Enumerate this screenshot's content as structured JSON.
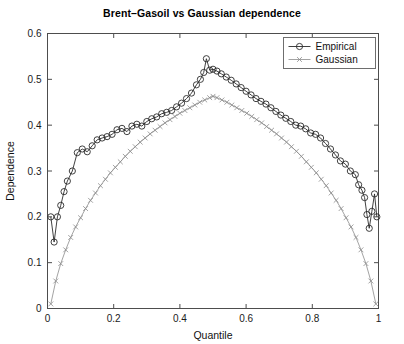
{
  "chart_data": {
    "type": "line",
    "title": "Brent–Gasoil vs Gaussian dependence",
    "xlabel": "Quantile",
    "ylabel": "Dependence",
    "xlim": [
      0,
      1
    ],
    "ylim": [
      0,
      0.6
    ],
    "xticks": [
      "0",
      "0.2",
      "0.4",
      "0.6",
      "0.8",
      "1"
    ],
    "xtick_values": [
      0,
      0.2,
      0.4,
      0.6,
      0.8,
      1
    ],
    "yticks": [
      "0",
      "0.1",
      "0.2",
      "0.3",
      "0.4",
      "0.5",
      "0.6"
    ],
    "ytick_values": [
      0,
      0.1,
      0.2,
      0.3,
      0.4,
      0.5,
      0.6
    ],
    "grid": false,
    "legend_position": "top-right",
    "legend": [
      "Empirical",
      "Gaussian"
    ],
    "series": [
      {
        "name": "Empirical",
        "marker": "circle",
        "color": "#2b2b2b",
        "x": [
          0.01,
          0.02,
          0.03,
          0.04,
          0.05,
          0.06,
          0.075,
          0.09,
          0.105,
          0.12,
          0.135,
          0.15,
          0.165,
          0.18,
          0.195,
          0.21,
          0.225,
          0.24,
          0.255,
          0.27,
          0.285,
          0.3,
          0.315,
          0.33,
          0.345,
          0.36,
          0.375,
          0.39,
          0.405,
          0.42,
          0.435,
          0.45,
          0.462,
          0.472,
          0.48,
          0.49,
          0.5,
          0.512,
          0.525,
          0.54,
          0.555,
          0.57,
          0.585,
          0.6,
          0.615,
          0.63,
          0.645,
          0.66,
          0.675,
          0.69,
          0.705,
          0.72,
          0.735,
          0.75,
          0.765,
          0.78,
          0.795,
          0.81,
          0.825,
          0.84,
          0.855,
          0.87,
          0.885,
          0.9,
          0.915,
          0.93,
          0.94,
          0.95,
          0.958,
          0.965,
          0.972,
          0.98,
          0.988,
          0.995
        ],
        "y": [
          0.2,
          0.145,
          0.2,
          0.225,
          0.255,
          0.278,
          0.3,
          0.34,
          0.348,
          0.342,
          0.355,
          0.368,
          0.372,
          0.375,
          0.38,
          0.39,
          0.393,
          0.386,
          0.398,
          0.402,
          0.398,
          0.408,
          0.414,
          0.418,
          0.425,
          0.428,
          0.432,
          0.44,
          0.448,
          0.458,
          0.47,
          0.488,
          0.5,
          0.515,
          0.545,
          0.52,
          0.522,
          0.518,
          0.512,
          0.505,
          0.498,
          0.49,
          0.482,
          0.474,
          0.466,
          0.458,
          0.452,
          0.446,
          0.438,
          0.43,
          0.422,
          0.415,
          0.408,
          0.4,
          0.398,
          0.392,
          0.383,
          0.38,
          0.372,
          0.36,
          0.348,
          0.335,
          0.322,
          0.315,
          0.3,
          0.292,
          0.27,
          0.258,
          0.242,
          0.205,
          0.175,
          0.212,
          0.25,
          0.2
        ]
      },
      {
        "name": "Gaussian",
        "marker": "x",
        "color": "#8c8c8c",
        "x": [
          0.01,
          0.025,
          0.04,
          0.055,
          0.07,
          0.085,
          0.1,
          0.115,
          0.13,
          0.145,
          0.16,
          0.175,
          0.19,
          0.205,
          0.22,
          0.235,
          0.25,
          0.265,
          0.28,
          0.295,
          0.31,
          0.325,
          0.34,
          0.355,
          0.37,
          0.385,
          0.4,
          0.415,
          0.43,
          0.445,
          0.46,
          0.475,
          0.49,
          0.5,
          0.512,
          0.527,
          0.542,
          0.557,
          0.572,
          0.587,
          0.602,
          0.617,
          0.632,
          0.647,
          0.662,
          0.677,
          0.692,
          0.707,
          0.722,
          0.737,
          0.752,
          0.767,
          0.782,
          0.797,
          0.812,
          0.827,
          0.842,
          0.857,
          0.872,
          0.887,
          0.902,
          0.917,
          0.932,
          0.947,
          0.962,
          0.977,
          0.992
        ],
        "y": [
          0.01,
          0.06,
          0.098,
          0.128,
          0.155,
          0.178,
          0.198,
          0.218,
          0.236,
          0.252,
          0.268,
          0.282,
          0.296,
          0.308,
          0.32,
          0.332,
          0.343,
          0.353,
          0.363,
          0.372,
          0.381,
          0.389,
          0.397,
          0.405,
          0.412,
          0.419,
          0.426,
          0.432,
          0.438,
          0.444,
          0.45,
          0.455,
          0.46,
          0.463,
          0.46,
          0.455,
          0.45,
          0.444,
          0.438,
          0.432,
          0.426,
          0.419,
          0.412,
          0.405,
          0.397,
          0.389,
          0.381,
          0.372,
          0.363,
          0.353,
          0.343,
          0.332,
          0.32,
          0.308,
          0.296,
          0.282,
          0.268,
          0.252,
          0.236,
          0.218,
          0.198,
          0.178,
          0.155,
          0.128,
          0.098,
          0.06,
          0.01
        ]
      }
    ]
  }
}
